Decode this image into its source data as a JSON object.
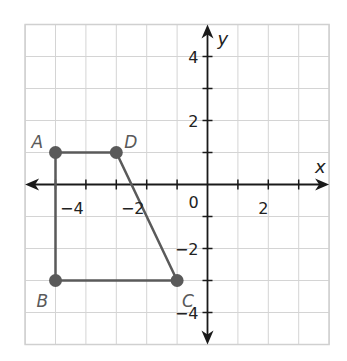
{
  "diagram": {
    "type": "coordinate-plane",
    "axes": {
      "x_label": "x",
      "y_label": "y",
      "x_range": [
        -6,
        4
      ],
      "y_range": [
        -5,
        5
      ],
      "origin_label": "0",
      "x_tick_labels": [
        {
          "value": -4,
          "text": "−4"
        },
        {
          "value": -2,
          "text": "−2"
        },
        {
          "value": 2,
          "text": "2"
        }
      ],
      "y_tick_labels": [
        {
          "value": 4,
          "text": "4"
        },
        {
          "value": 2,
          "text": "2"
        },
        {
          "value": -2,
          "text": "−2"
        },
        {
          "value": -4,
          "text": "−4"
        }
      ]
    },
    "polygon": {
      "name": "ABCD",
      "vertices": [
        {
          "label": "A",
          "x": -5,
          "y": 1
        },
        {
          "label": "B",
          "x": -5,
          "y": -3
        },
        {
          "label": "C",
          "x": -1,
          "y": -3
        },
        {
          "label": "D",
          "x": -3,
          "y": 1
        }
      ],
      "color": "#5a5a5a"
    },
    "colors": {
      "grid": "#d4d4d4",
      "axis": "#1a1a1a",
      "shape": "#5a5a5a"
    }
  }
}
